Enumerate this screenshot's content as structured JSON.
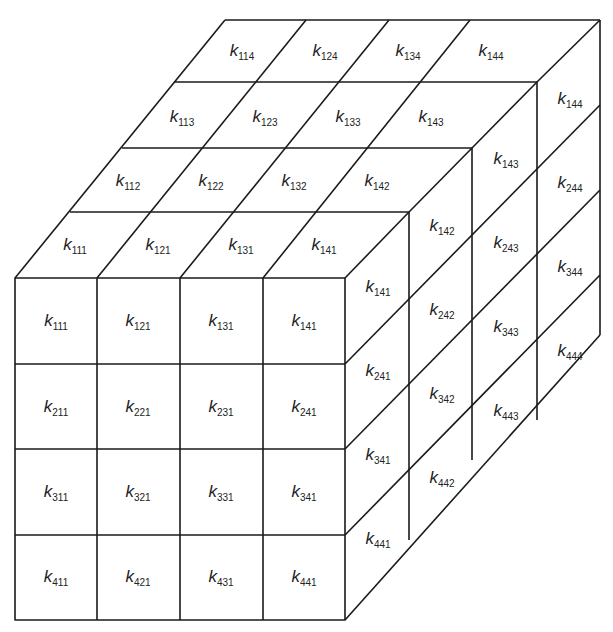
{
  "diagram": {
    "symbol": "k",
    "front_face": [
      [
        "111",
        "121",
        "131",
        "141"
      ],
      [
        "211",
        "221",
        "231",
        "241"
      ],
      [
        "311",
        "321",
        "331",
        "341"
      ],
      [
        "411",
        "421",
        "431",
        "441"
      ]
    ],
    "top_face": [
      [
        "114",
        "124",
        "134",
        "144"
      ],
      [
        "113",
        "123",
        "133",
        "143"
      ],
      [
        "112",
        "122",
        "132",
        "142"
      ],
      [
        "111",
        "121",
        "131",
        "141"
      ]
    ],
    "right_face": [
      [
        "141",
        "241",
        "341",
        "441"
      ],
      [
        "142",
        "242",
        "342",
        "442"
      ],
      [
        "143",
        "243",
        "343",
        "443"
      ],
      [
        "144",
        "244",
        "344",
        "444"
      ]
    ]
  }
}
